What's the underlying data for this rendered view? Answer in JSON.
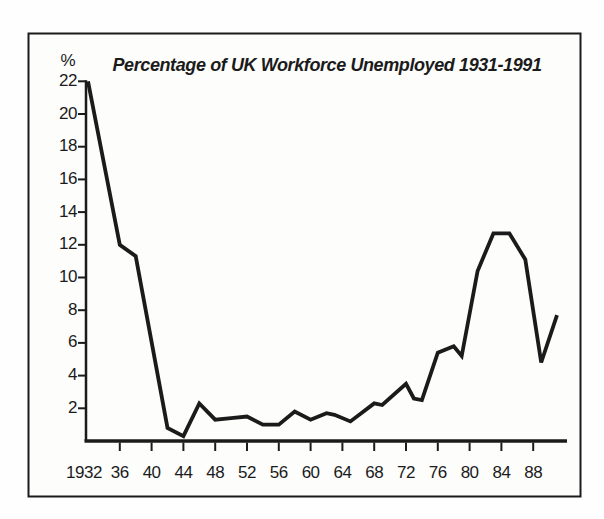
{
  "figure": {
    "title": "Percentage of UK Workforce Unemployed 1931-1991",
    "unit_label": "%"
  },
  "palette": {
    "ink": "#1b1b1b",
    "paper": "#fdfdfb"
  },
  "chart_data": {
    "type": "line",
    "title": "Percentage of UK Workforce Unemployed 1931-1991",
    "xlabel": "",
    "ylabel": "%",
    "xlim": [
      1932,
      1992
    ],
    "ylim": [
      0,
      22
    ],
    "grid": false,
    "legend": false,
    "y_ticks": [
      22,
      20,
      18,
      16,
      14,
      12,
      10,
      8,
      6,
      4,
      2
    ],
    "x_ticks": [
      {
        "year": 1932,
        "label": "1932"
      },
      {
        "year": 1936,
        "label": "36"
      },
      {
        "year": 1940,
        "label": "40"
      },
      {
        "year": 1944,
        "label": "44"
      },
      {
        "year": 1948,
        "label": "48"
      },
      {
        "year": 1952,
        "label": "52"
      },
      {
        "year": 1956,
        "label": "56"
      },
      {
        "year": 1960,
        "label": "60"
      },
      {
        "year": 1964,
        "label": "64"
      },
      {
        "year": 1968,
        "label": "68"
      },
      {
        "year": 1972,
        "label": "72"
      },
      {
        "year": 1976,
        "label": "76"
      },
      {
        "year": 1980,
        "label": "80"
      },
      {
        "year": 1984,
        "label": "84"
      },
      {
        "year": 1988,
        "label": "88"
      }
    ],
    "series": [
      {
        "name": "UK unemployment rate (% of workforce)",
        "points": [
          {
            "year": 1932,
            "value": 22.0
          },
          {
            "year": 1936,
            "value": 12.0
          },
          {
            "year": 1938,
            "value": 11.3
          },
          {
            "year": 1942,
            "value": 0.8
          },
          {
            "year": 1944,
            "value": 0.3
          },
          {
            "year": 1946,
            "value": 2.3
          },
          {
            "year": 1948,
            "value": 1.3
          },
          {
            "year": 1950,
            "value": 1.4
          },
          {
            "year": 1952,
            "value": 1.5
          },
          {
            "year": 1954,
            "value": 1.0
          },
          {
            "year": 1956,
            "value": 1.0
          },
          {
            "year": 1958,
            "value": 1.8
          },
          {
            "year": 1960,
            "value": 1.3
          },
          {
            "year": 1962,
            "value": 1.7
          },
          {
            "year": 1963,
            "value": 1.6
          },
          {
            "year": 1965,
            "value": 1.2
          },
          {
            "year": 1968,
            "value": 2.3
          },
          {
            "year": 1969,
            "value": 2.2
          },
          {
            "year": 1972,
            "value": 3.5
          },
          {
            "year": 1973,
            "value": 2.6
          },
          {
            "year": 1974,
            "value": 2.5
          },
          {
            "year": 1976,
            "value": 5.4
          },
          {
            "year": 1978,
            "value": 5.8
          },
          {
            "year": 1979,
            "value": 5.2
          },
          {
            "year": 1981,
            "value": 10.4
          },
          {
            "year": 1983,
            "value": 12.7
          },
          {
            "year": 1985,
            "value": 12.7
          },
          {
            "year": 1987,
            "value": 11.1
          },
          {
            "year": 1989,
            "value": 4.8
          },
          {
            "year": 1991,
            "value": 7.7
          }
        ]
      }
    ]
  }
}
